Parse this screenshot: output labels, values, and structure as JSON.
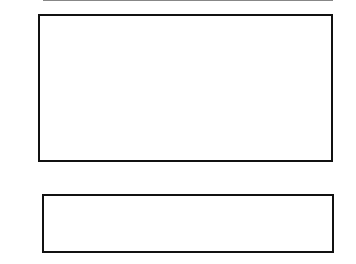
{
  "chart_data": [
    {
      "type": "line",
      "title": "",
      "xlabel": "kilometer",
      "ylabel": "mGal",
      "xlim": [
        0,
        62
      ],
      "ylim": [
        -64,
        -29
      ],
      "x_ticks": [
        "0",
        "10",
        "20",
        "30",
        "40",
        "50",
        "60",
        "62"
      ],
      "y_ticks": [
        "-29",
        "-40",
        "-50",
        "-60",
        "-64"
      ],
      "grid": false,
      "series": [
        {
          "name": "observed gravity (crosses)",
          "marker": "+",
          "x": [
            0,
            2,
            4,
            6,
            8,
            10,
            12,
            14,
            16,
            18,
            19,
            20,
            21,
            22,
            24,
            26,
            28,
            30,
            32,
            34,
            36,
            38,
            40,
            42,
            44,
            46,
            48,
            49,
            50,
            52,
            54,
            56,
            58,
            60,
            62
          ],
          "y": [
            -36,
            -37.5,
            -36,
            -32,
            -33,
            -35,
            -40,
            -46,
            -52,
            -56,
            -55,
            -53,
            -54,
            -55,
            -58,
            -62,
            -61,
            -57,
            -55,
            -57,
            -59.5,
            -57,
            -55,
            -52,
            -48,
            -42,
            -37,
            -35.3,
            -35.3,
            -35.5,
            -35,
            -34,
            -33,
            -31,
            -30
          ]
        },
        {
          "name": "calculated gravity (line)",
          "x": [
            0,
            2,
            4,
            6,
            8,
            10,
            12,
            14,
            16,
            18,
            19,
            20,
            21,
            22,
            24,
            26,
            28,
            30,
            32,
            34,
            36,
            38,
            40,
            42,
            44,
            46,
            48,
            49,
            50,
            52,
            54,
            56,
            58,
            60,
            62
          ],
          "y": [
            -36,
            -37,
            -35.5,
            -32,
            -33,
            -35,
            -40,
            -46,
            -52,
            -56,
            -55,
            -53,
            -54,
            -55,
            -58,
            -62,
            -61,
            -57,
            -55,
            -57,
            -59.5,
            -57,
            -55,
            -52,
            -48,
            -42,
            -37,
            -35.3,
            -35,
            -34.8,
            -34.5,
            -34,
            -33,
            -31,
            -30
          ]
        }
      ]
    },
    {
      "type": "area",
      "title": "cross-section",
      "xlabel": "",
      "ylabel": "",
      "xlim": [
        0,
        62
      ],
      "ylim": [
        11,
        0
      ],
      "y_ticks": [
        "0",
        "5",
        "11"
      ],
      "horizontal_line_at": 5,
      "orientation_labels": {
        "left": "NW",
        "right": "SE"
      },
      "series": [
        {
          "name": "dark body",
          "color": "#333333",
          "polygons": [
            [
              [
                3,
                0
              ],
              [
                27,
                0
              ],
              [
                23,
                1.8
              ],
              [
                20,
                1.6
              ],
              [
                15,
                0.8
              ],
              [
                3,
                1.2
              ]
            ],
            [
              [
                61,
                0
              ],
              [
                62,
                0
              ],
              [
                62,
                1
              ]
            ]
          ]
        },
        {
          "name": "gray body",
          "color": "#b8b8b8",
          "polygons": [
            [
              [
                10,
                0.8
              ],
              [
                16,
                1.0
              ],
              [
                18,
                5.5
              ],
              [
                23,
                10.5
              ],
              [
                27,
                8
              ],
              [
                27,
                0
              ],
              [
                23,
                1.6
              ],
              [
                20,
                1.6
              ]
            ],
            [
              [
                27,
                0
              ],
              [
                32,
                0
              ],
              [
                30,
                2
              ],
              [
                34,
                0.7
              ],
              [
                46,
                0
              ],
              [
                44,
                2
              ],
              [
                40,
                2.5
              ],
              [
                30,
                6
              ],
              [
                28,
                6.5
              ],
              [
                27,
                4
              ]
            ]
          ]
        }
      ]
    }
  ],
  "top_plot": {
    "y_labels": [
      "-29",
      "-40",
      "-50",
      "-60",
      "-64"
    ],
    "x_labels": [
      "0",
      "10",
      "20",
      "30",
      "40",
      "50",
      "60",
      "62"
    ],
    "ylabel": "mGal",
    "xlabel": "kilometer"
  },
  "bottom_plot": {
    "left_label": "NW",
    "right_label": "SE",
    "y_labels": [
      "0",
      "5",
      "11"
    ]
  }
}
